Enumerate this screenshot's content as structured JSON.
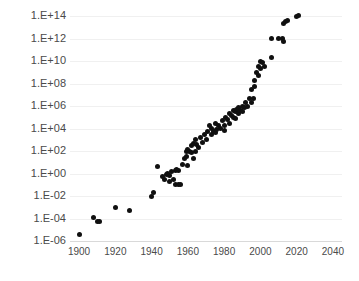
{
  "chart_data": {
    "type": "scatter",
    "title": "",
    "subtitle": "",
    "xlabel": "",
    "ylabel": "",
    "xlim": [
      1895,
      2045
    ],
    "ylim": [
      1e-06,
      100000000000000.0
    ],
    "yscale": "log",
    "xscale": "linear",
    "grid": true,
    "legend": null,
    "legend_position": "none",
    "xticks": [
      1900,
      1920,
      1940,
      1960,
      1980,
      2000,
      2020,
      2040
    ],
    "xtick_labels": [
      "1900",
      "1920",
      "1940",
      "1960",
      "1980",
      "2000",
      "2020",
      "2040"
    ],
    "yticks": [
      1e-06,
      0.0001,
      0.01,
      1.0,
      100.0,
      10000.0,
      1000000.0,
      100000000.0,
      10000000000.0,
      1000000000000.0,
      100000000000000.0
    ],
    "ytick_labels": [
      "1.E-06",
      "1.E-04",
      "1.E-02",
      "1.E+00",
      "1.E+02",
      "1.E+04",
      "1.E+06",
      "1.E+08",
      "1.E+10",
      "1.E+12",
      "1.E+14"
    ],
    "marker": {
      "shape": "circle",
      "color": "#101010",
      "size_px": 5
    },
    "series": [
      {
        "name": "",
        "color": "#101010",
        "points": [
          {
            "x": 1900,
            "y": 4e-06
          },
          {
            "x": 1908,
            "y": 0.00012
          },
          {
            "x": 1910,
            "y": 6e-05
          },
          {
            "x": 1911,
            "y": 5e-05
          },
          {
            "x": 1920,
            "y": 0.0009
          },
          {
            "x": 1928,
            "y": 0.0005
          },
          {
            "x": 1940,
            "y": 0.01
          },
          {
            "x": 1941,
            "y": 0.02
          },
          {
            "x": 1943,
            "y": 4.0
          },
          {
            "x": 1946,
            "y": 0.6
          },
          {
            "x": 1947,
            "y": 0.3
          },
          {
            "x": 1948,
            "y": 0.8
          },
          {
            "x": 1949,
            "y": 1.0
          },
          {
            "x": 1950,
            "y": 0.7
          },
          {
            "x": 1950,
            "y": 0.2
          },
          {
            "x": 1951,
            "y": 1.5
          },
          {
            "x": 1952,
            "y": 0.3
          },
          {
            "x": 1953,
            "y": 2.0
          },
          {
            "x": 1953,
            "y": 0.1
          },
          {
            "x": 1954,
            "y": 2.5
          },
          {
            "x": 1955,
            "y": 0.1
          },
          {
            "x": 1955,
            "y": 2.0
          },
          {
            "x": 1956,
            "y": 0.1
          },
          {
            "x": 1957,
            "y": 6.0
          },
          {
            "x": 1958,
            "y": 20.0
          },
          {
            "x": 1959,
            "y": 100.0
          },
          {
            "x": 1959,
            "y": 30.0
          },
          {
            "x": 1960,
            "y": 150.0
          },
          {
            "x": 1960,
            "y": 5.0
          },
          {
            "x": 1961,
            "y": 100.0
          },
          {
            "x": 1962,
            "y": 70.0
          },
          {
            "x": 1962,
            "y": 300.0
          },
          {
            "x": 1963,
            "y": 500.0
          },
          {
            "x": 1963,
            "y": 20.0
          },
          {
            "x": 1964,
            "y": 1000.0
          },
          {
            "x": 1964,
            "y": 100.0
          },
          {
            "x": 1965,
            "y": 400.0
          },
          {
            "x": 1966,
            "y": 200.0
          },
          {
            "x": 1967,
            "y": 1500.0
          },
          {
            "x": 1968,
            "y": 600.0
          },
          {
            "x": 1969,
            "y": 3000.0
          },
          {
            "x": 1970,
            "y": 1000.0
          },
          {
            "x": 1971,
            "y": 6000.0
          },
          {
            "x": 1972,
            "y": 20000.0
          },
          {
            "x": 1973,
            "y": 10000.0
          },
          {
            "x": 1973,
            "y": 3000.0
          },
          {
            "x": 1974,
            "y": 5000.0
          },
          {
            "x": 1975,
            "y": 30000.0
          },
          {
            "x": 1975,
            "y": 4000.0
          },
          {
            "x": 1976,
            "y": 8000.0
          },
          {
            "x": 1977,
            "y": 20000.0
          },
          {
            "x": 1978,
            "y": 10000.0
          },
          {
            "x": 1979,
            "y": 50000.0
          },
          {
            "x": 1980,
            "y": 20000.0
          },
          {
            "x": 1980,
            "y": 7000.0
          },
          {
            "x": 1981,
            "y": 100000.0
          },
          {
            "x": 1982,
            "y": 60000.0
          },
          {
            "x": 1983,
            "y": 200000.0
          },
          {
            "x": 1983,
            "y": 30000.0
          },
          {
            "x": 1984,
            "y": 150000.0
          },
          {
            "x": 1985,
            "y": 400000.0
          },
          {
            "x": 1985,
            "y": 100000.0
          },
          {
            "x": 1986,
            "y": 300000.0
          },
          {
            "x": 1986,
            "y": 80000.0
          },
          {
            "x": 1987,
            "y": 500000.0
          },
          {
            "x": 1988,
            "y": 200000.0
          },
          {
            "x": 1988,
            "y": 700000.0
          },
          {
            "x": 1989,
            "y": 400000.0
          },
          {
            "x": 1990,
            "y": 1000000.0
          },
          {
            "x": 1990,
            "y": 300000.0
          },
          {
            "x": 1991,
            "y": 800000.0
          },
          {
            "x": 1992,
            "y": 2000000.0
          },
          {
            "x": 1993,
            "y": 1000000.0
          },
          {
            "x": 1994,
            "y": 5000000.0
          },
          {
            "x": 1995,
            "y": 2000000.0
          },
          {
            "x": 1995,
            "y": 30000000.0
          },
          {
            "x": 1996,
            "y": 5000000.0
          },
          {
            "x": 1997,
            "y": 200000000.0
          },
          {
            "x": 1997,
            "y": 60000000.0
          },
          {
            "x": 1998,
            "y": 1000000000.0
          },
          {
            "x": 1999,
            "y": 3000000000.0
          },
          {
            "x": 1999,
            "y": 500000000.0
          },
          {
            "x": 2000,
            "y": 10000000000.0
          },
          {
            "x": 2000,
            "y": 2000000000.0
          },
          {
            "x": 2001,
            "y": 8000000000.0
          },
          {
            "x": 2002,
            "y": 3000000000.0
          },
          {
            "x": 2006,
            "y": 20000000000.0
          },
          {
            "x": 2006,
            "y": 1000000000000.0
          },
          {
            "x": 2010,
            "y": 1000000000000.0
          },
          {
            "x": 2012,
            "y": 1000000000000.0
          },
          {
            "x": 2013,
            "y": 600000000000.0
          },
          {
            "x": 2013,
            "y": 20000000000000.0
          },
          {
            "x": 2014,
            "y": 30000000000000.0
          },
          {
            "x": 2015,
            "y": 40000000000000.0
          },
          {
            "x": 2020,
            "y": 100000000000000.0
          },
          {
            "x": 2021,
            "y": 120000000000000.0
          }
        ]
      }
    ]
  }
}
